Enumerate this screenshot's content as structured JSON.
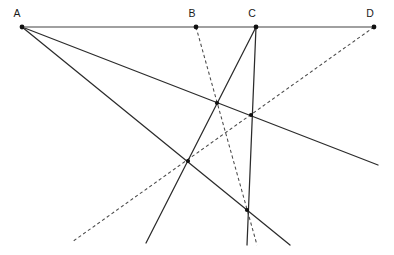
{
  "figure": {
    "canvas": {
      "width": 394,
      "height": 255
    },
    "background_color": "#ffffff",
    "baseline_color": "#808080",
    "solid_line_color": "#2b2b2b",
    "dashed_line_color": "#4a4a4a",
    "dot_color": "#111111"
  },
  "labels": {
    "a": "A",
    "b": "B",
    "c": "C",
    "d": "D"
  },
  "chart_data": {
    "type": "diagram",
    "xlabel": "",
    "ylabel": "",
    "xlim": [
      0,
      394
    ],
    "ylim": [
      255,
      0
    ],
    "grid": false,
    "legend": "none",
    "baseline": {
      "name": "baseline-AD",
      "style": "solid",
      "color": "#808080",
      "x1": 22,
      "y1": 27,
      "x2": 374,
      "y2": 27
    },
    "labeled_points": [
      {
        "label": "A",
        "x": 22,
        "y": 27,
        "label_x": 17,
        "label_y": 17
      },
      {
        "label": "B",
        "x": 196,
        "y": 27,
        "label_x": 192,
        "label_y": 17
      },
      {
        "label": "C",
        "x": 256,
        "y": 27,
        "label_x": 252,
        "label_y": 17
      },
      {
        "label": "D",
        "x": 374,
        "y": 27,
        "label_x": 370,
        "label_y": 17
      }
    ],
    "solid_lines": [
      {
        "name": "ray-A-shallow",
        "x1": 22,
        "y1": 27,
        "x2": 378,
        "y2": 165
      },
      {
        "name": "ray-A-steep",
        "x1": 22,
        "y1": 27,
        "x2": 290,
        "y2": 245
      },
      {
        "name": "ray-C-vertical",
        "x1": 256,
        "y1": 27,
        "x2": 247,
        "y2": 245
      },
      {
        "name": "ray-C-downleft",
        "x1": 256,
        "y1": 27,
        "x2": 146,
        "y2": 243
      }
    ],
    "dashed_lines": [
      {
        "name": "ray-B-dashed",
        "x1": 196,
        "y1": 27,
        "x2": 257,
        "y2": 245
      },
      {
        "name": "ray-D-dashed",
        "x1": 374,
        "y1": 27,
        "x2": 72,
        "y2": 242
      }
    ],
    "intersection_points": [
      {
        "name": "node-upper-left",
        "x": 217,
        "y": 103
      },
      {
        "name": "node-upper-right",
        "x": 251,
        "y": 115
      },
      {
        "name": "node-middle",
        "x": 188,
        "y": 161
      },
      {
        "name": "node-lower",
        "x": 247,
        "y": 210
      }
    ]
  }
}
